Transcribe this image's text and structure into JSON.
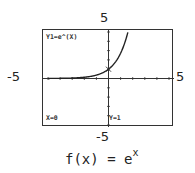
{
  "chart_data": {
    "type": "line",
    "function": "e^x",
    "xlim": [
      -5,
      5
    ],
    "ylim": [
      -5,
      5
    ],
    "tick_labels": {
      "ymax": "5",
      "ymin": "-5",
      "xmin": "-5",
      "xmax": "5"
    },
    "series": [
      {
        "name": "Y1=e^(X)",
        "x": [
          -5,
          -4,
          -3,
          -2,
          -1,
          0,
          0.5,
          1,
          1.5,
          1.6
        ],
        "y": [
          0.007,
          0.018,
          0.05,
          0.135,
          0.368,
          1,
          1.649,
          2.718,
          4.482,
          4.953
        ]
      }
    ],
    "trace_point": {
      "x": 0,
      "y": 1
    },
    "grid": false,
    "axis_ticks": "unit spacing"
  },
  "labels": {
    "top": "5",
    "left": "-5",
    "right": "5",
    "bottom": "-5"
  },
  "screen": {
    "equation": "Y1=e^(X)",
    "x_readout": "X=0",
    "y_readout": "Y=1"
  },
  "caption": {
    "prefix": "f(x) = e",
    "exponent": "x"
  }
}
